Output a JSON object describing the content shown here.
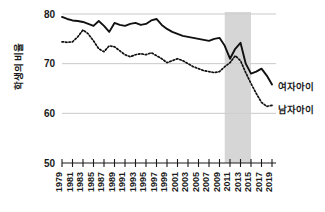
{
  "chart_data": {
    "type": "line",
    "title": "",
    "xlabel": "",
    "ylabel": "학생의 비율",
    "ylim": [
      50,
      80
    ],
    "xlim": [
      1979,
      2019
    ],
    "yticks": [
      50,
      60,
      70,
      80
    ],
    "ytick_labels": [
      "50",
      "60",
      "70",
      "80"
    ],
    "grid": true,
    "grid_values": [
      60,
      70,
      80
    ],
    "legend_position": "right",
    "x": [
      1979,
      1980,
      1981,
      1982,
      1983,
      1984,
      1985,
      1986,
      1987,
      1988,
      1989,
      1990,
      1991,
      1992,
      1993,
      1994,
      1995,
      1996,
      1997,
      1998,
      1999,
      2000,
      2001,
      2002,
      2003,
      2004,
      2005,
      2006,
      2007,
      2008,
      2009,
      2010,
      2011,
      2012,
      2013,
      2014,
      2015,
      2016,
      2017,
      2018,
      2019
    ],
    "xtick_labels": [
      "1979",
      "1981",
      "1983",
      "1985",
      "1987",
      "1989",
      "1991",
      "1993",
      "1995",
      "1997",
      "1999",
      "2001",
      "2003",
      "2005",
      "2007",
      "2009",
      "2011",
      "2013",
      "2015",
      "2017",
      "2019"
    ],
    "xtick_values": [
      1979,
      1981,
      1983,
      1985,
      1987,
      1989,
      1991,
      1993,
      1995,
      1997,
      1999,
      2001,
      2003,
      2005,
      2007,
      2009,
      2011,
      2013,
      2015,
      2017,
      2019
    ],
    "annotations": [
      {
        "type": "vspan",
        "label": "shaded-period",
        "x_start": 2010,
        "x_end": 2015,
        "color": "#cfcfcf"
      }
    ],
    "series": [
      {
        "name": "여자아이",
        "style": "solid",
        "color": "#111111",
        "values": [
          79.4,
          79.0,
          78.7,
          78.6,
          78.4,
          78.0,
          77.6,
          78.6,
          77.6,
          76.4,
          78.2,
          77.8,
          77.6,
          78.0,
          78.2,
          77.8,
          78.0,
          78.7,
          79.0,
          77.8,
          77.0,
          76.4,
          76.0,
          75.6,
          75.4,
          75.2,
          75.0,
          74.8,
          74.6,
          75.0,
          75.2,
          73.6,
          71.0,
          73.0,
          74.2,
          70.0,
          68.0,
          68.4,
          69.0,
          67.6,
          65.8
        ]
      },
      {
        "name": "남자아이",
        "style": "dotted",
        "color": "#111111",
        "values": [
          74.4,
          74.3,
          74.4,
          75.4,
          76.8,
          76.0,
          74.6,
          73.0,
          72.4,
          73.6,
          73.4,
          72.6,
          71.8,
          71.4,
          71.8,
          72.0,
          71.8,
          72.2,
          71.6,
          71.0,
          70.2,
          70.6,
          71.0,
          70.6,
          70.0,
          69.4,
          69.0,
          68.6,
          68.4,
          68.2,
          68.4,
          69.4,
          70.2,
          71.6,
          70.6,
          68.2,
          66.0,
          64.0,
          62.2,
          61.4,
          61.6
        ]
      }
    ]
  },
  "legend": {
    "items": [
      {
        "label": "여자아이"
      },
      {
        "label": "남자아이"
      }
    ]
  }
}
